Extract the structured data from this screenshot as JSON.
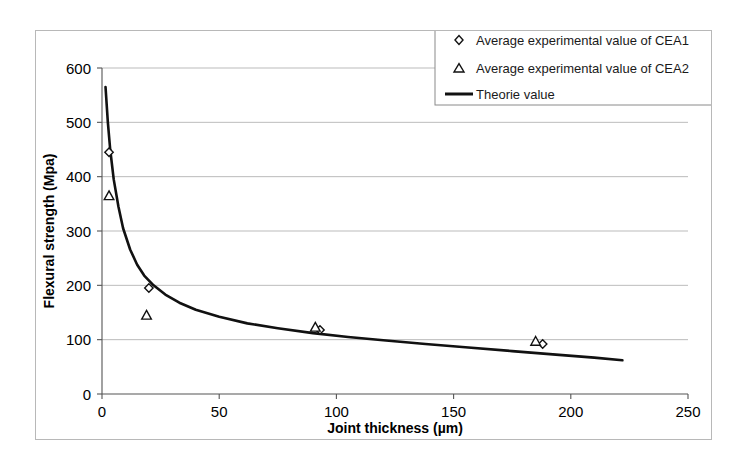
{
  "chart_data": {
    "type": "scatter",
    "title": "",
    "xlabel": "Joint thickness (µm)",
    "ylabel": "Flexural strength (Mpa)",
    "xlim": [
      0,
      250
    ],
    "ylim": [
      0,
      600
    ],
    "xticks": [
      0,
      50,
      100,
      150,
      200,
      250
    ],
    "yticks": [
      0,
      100,
      200,
      300,
      400,
      500,
      600
    ],
    "xtick_labels": [
      "0",
      "50",
      "100",
      "150",
      "200",
      "250"
    ],
    "ytick_labels": [
      "0",
      "100",
      "200",
      "300",
      "400",
      "500",
      "600"
    ],
    "grid": "horizontal",
    "legend_position": "top-right",
    "series": [
      {
        "name": "Average experimental value of CEA1",
        "marker": "diamond",
        "type": "scatter",
        "points": [
          {
            "x": 3,
            "y": 445
          },
          {
            "x": 20,
            "y": 195
          },
          {
            "x": 93,
            "y": 118
          },
          {
            "x": 188,
            "y": 92
          }
        ]
      },
      {
        "name": "Average experimental value of CEA2",
        "marker": "triangle",
        "type": "scatter",
        "points": [
          {
            "x": 3,
            "y": 365
          },
          {
            "x": 19,
            "y": 145
          },
          {
            "x": 91,
            "y": 123
          },
          {
            "x": 185,
            "y": 97
          }
        ]
      },
      {
        "name": "Theorie value",
        "marker": "line",
        "type": "line",
        "points": [
          {
            "x": 1.5,
            "y": 565
          },
          {
            "x": 2.5,
            "y": 500
          },
          {
            "x": 3.5,
            "y": 450
          },
          {
            "x": 5,
            "y": 395
          },
          {
            "x": 7,
            "y": 345
          },
          {
            "x": 9,
            "y": 305
          },
          {
            "x": 12,
            "y": 266
          },
          {
            "x": 15,
            "y": 238
          },
          {
            "x": 18,
            "y": 218
          },
          {
            "x": 22,
            "y": 200
          },
          {
            "x": 27,
            "y": 183
          },
          {
            "x": 33,
            "y": 168
          },
          {
            "x": 40,
            "y": 155
          },
          {
            "x": 50,
            "y": 142
          },
          {
            "x": 62,
            "y": 130
          },
          {
            "x": 75,
            "y": 121
          },
          {
            "x": 90,
            "y": 112
          },
          {
            "x": 105,
            "y": 105
          },
          {
            "x": 120,
            "y": 99
          },
          {
            "x": 138,
            "y": 92
          },
          {
            "x": 155,
            "y": 86
          },
          {
            "x": 175,
            "y": 79
          },
          {
            "x": 195,
            "y": 72
          },
          {
            "x": 210,
            "y": 67
          },
          {
            "x": 222,
            "y": 62
          }
        ]
      }
    ],
    "legend": [
      {
        "label": "Average experimental value of CEA1",
        "marker": "diamond"
      },
      {
        "label": "Average experimental value of CEA2",
        "marker": "triangle"
      },
      {
        "label": "Theorie value",
        "marker": "line"
      }
    ]
  }
}
